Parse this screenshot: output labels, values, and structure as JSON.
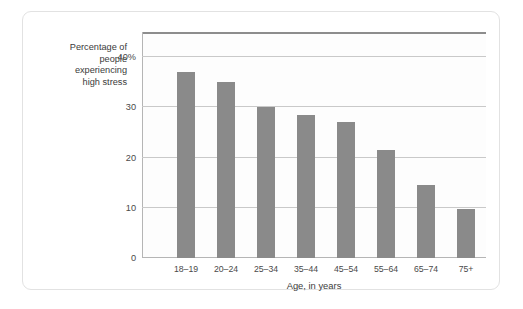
{
  "chart_data": {
    "type": "bar",
    "title": "",
    "subtitle": "",
    "xlabel": "Age, in years",
    "ylabel": "Percentage of\npeople\nexperiencing\nhigh stress",
    "categories": [
      "18–19",
      "20–24",
      "25–34",
      "35–44",
      "45–54",
      "55–64",
      "65–74",
      "75+"
    ],
    "values": [
      37,
      35,
      30,
      28.5,
      27,
      21.5,
      14.5,
      9.7
    ],
    "ylim": [
      0,
      45
    ],
    "yticks": [
      0,
      10,
      20,
      30,
      40
    ],
    "ytick_labels": [
      "0",
      "10",
      "20",
      "30",
      "40%"
    ],
    "grid": true,
    "legend": "none",
    "bar_color": "#8a8a8a",
    "gridline_color": "#c9c9c9",
    "axis_color": "#b5b5b5",
    "plot_background": "#fdfdfd",
    "card_border_color": "#e2e2e2"
  }
}
